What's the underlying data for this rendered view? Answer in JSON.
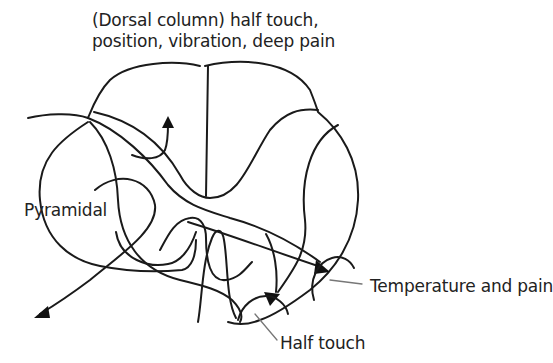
{
  "diagram": {
    "type": "spinal cord cross-section",
    "labels": {
      "dorsal_line1": "(Dorsal column) half touch,",
      "dorsal_line2": "position, vibration, deep pain",
      "pyramidal": "Pyramidal",
      "temperature": "Temperature and pain",
      "half_touch": "Half touch"
    },
    "colors": {
      "stroke": "#1a1a1a",
      "text": "#222222",
      "leader": "#777777",
      "background": "#ffffff"
    }
  }
}
